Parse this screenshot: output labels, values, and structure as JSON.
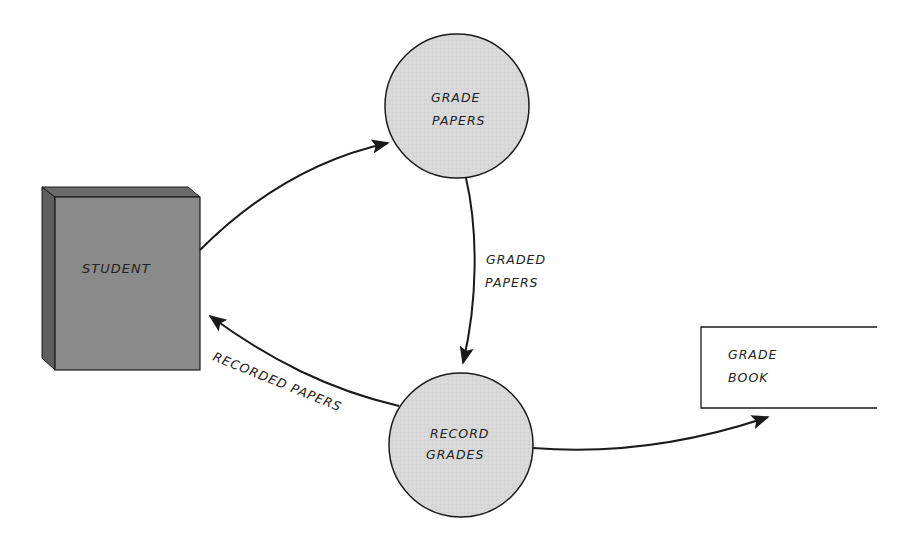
{
  "diagram": {
    "type": "data-flow-diagram",
    "colors": {
      "process_fill": "#d6d6d6",
      "entity_front": "#8a8a8a",
      "entity_side": "#5e5e5e",
      "stroke": "#1a1a1a",
      "background": "#ffffff"
    },
    "external_entities": [
      {
        "id": "student",
        "label": "STUDENT"
      }
    ],
    "processes": [
      {
        "id": "grade-papers",
        "lines": [
          "GRADE",
          "PAPERS"
        ]
      },
      {
        "id": "record-grades",
        "lines": [
          "RECORD",
          "GRADES"
        ]
      }
    ],
    "data_stores": [
      {
        "id": "grade-book",
        "lines": [
          "GRADE",
          "BOOK"
        ]
      }
    ],
    "flows": [
      {
        "from": "student",
        "to": "grade-papers",
        "label": ""
      },
      {
        "from": "grade-papers",
        "to": "record-grades",
        "lines": [
          "GRADED",
          "PAPERS"
        ]
      },
      {
        "from": "record-grades",
        "to": "student",
        "label": "RECORDED PAPERS"
      },
      {
        "from": "record-grades",
        "to": "grade-book",
        "label": ""
      }
    ]
  }
}
